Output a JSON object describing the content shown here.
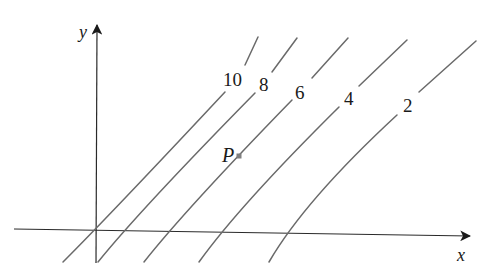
{
  "diagram": {
    "type": "contour-map",
    "axes": {
      "x_label": "x",
      "y_label": "y"
    },
    "point": {
      "label": "P",
      "color": "#808080"
    },
    "contours": [
      {
        "level": "10",
        "label": "10"
      },
      {
        "level": "8",
        "label": "8"
      },
      {
        "level": "6",
        "label": "6"
      },
      {
        "level": "4",
        "label": "4"
      },
      {
        "level": "2",
        "label": "2"
      }
    ],
    "colors": {
      "axis": "#2a2a2a",
      "contour": "#6a6a6a",
      "background": "#ffffff"
    }
  }
}
